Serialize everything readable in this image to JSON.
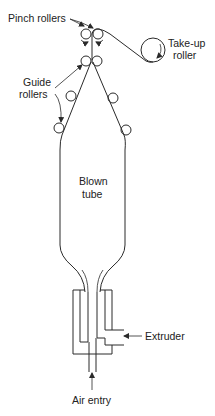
{
  "diagram": {
    "type": "blown-film-extrusion-schematic",
    "labels": {
      "pinch_rollers": "Pinch rollers",
      "take_up_line1": "Take-up",
      "take_up_line2": "roller",
      "guide_line1": "Guide",
      "guide_line2": "rollers",
      "blown_line1": "Blown",
      "blown_line2": "tube",
      "extruder": "Extruder",
      "air_entry": "Air entry"
    },
    "components": [
      {
        "id": "pinch-rollers",
        "count": 2
      },
      {
        "id": "take-up-roller",
        "count": 1
      },
      {
        "id": "guide-rollers",
        "count": 6
      },
      {
        "id": "blown-tube",
        "count": 1
      },
      {
        "id": "die",
        "count": 1
      }
    ],
    "colors": {
      "line": "#2a2a2a",
      "text": "#222222",
      "background": "#ffffff"
    }
  }
}
